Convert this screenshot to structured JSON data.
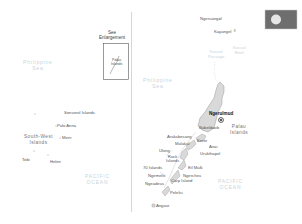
{
  "map": {
    "title": "Palau",
    "colors": {
      "land": "#d9d9d9",
      "coast": "#999999",
      "sea_label": "#c8d4dc",
      "divider": "#bbbbbb",
      "flag_field": "#6e6e6e",
      "flag_disc": "#e6e6e6"
    },
    "inset": {
      "title_line1": "See",
      "title_line2": "Enlargement",
      "label_line1": "Palau",
      "label_line2": "Islands"
    },
    "left_panel": {
      "sea_label_line1": "Philippine",
      "sea_label_line2": "Sea",
      "ocean_label_line1": "PACIFIC",
      "ocean_label_line2": "OCEAN",
      "places": [
        {
          "name": "Sonsorol Islands"
        },
        {
          "name": "Pulo Anna"
        },
        {
          "name": "Merir"
        },
        {
          "name": "Tobi"
        },
        {
          "name": "Helen"
        }
      ],
      "group_label_line1": "South-West",
      "group_label_line2": "Islands"
    },
    "right_panel": {
      "sea_label_line1": "Philippine",
      "sea_label_line2": "Sea",
      "ocean_label_line1": "PACIFIC",
      "ocean_label_line2": "OCEAN",
      "reefs": [
        {
          "line1": "Kossol",
          "line2": "Passage"
        },
        {
          "line1": "Kossol",
          "line2": "Reef"
        }
      ],
      "capital": "Ngerulmud",
      "group_label_line1": "Palau",
      "group_label_line2": "Islands",
      "places": [
        {
          "name": "Ngeruangel"
        },
        {
          "name": "Kayangel"
        },
        {
          "name": "Babeldaob"
        },
        {
          "name": "Arakabesang"
        },
        {
          "name": "Malakal"
        },
        {
          "name": "Koror"
        },
        {
          "name": "Airai"
        },
        {
          "name": "Urukthapel"
        },
        {
          "name": "Ulong"
        },
        {
          "name": "Rock"
        },
        {
          "name": "Islands"
        },
        {
          "name": "70 Islands"
        },
        {
          "name": "Eil Malk"
        },
        {
          "name": "Ngemelis"
        },
        {
          "name": "Ngercheu"
        },
        {
          "name": "Carp Island"
        },
        {
          "name": "Ngeadeus"
        },
        {
          "name": "Peleliu"
        },
        {
          "name": "Angaur"
        }
      ]
    }
  }
}
